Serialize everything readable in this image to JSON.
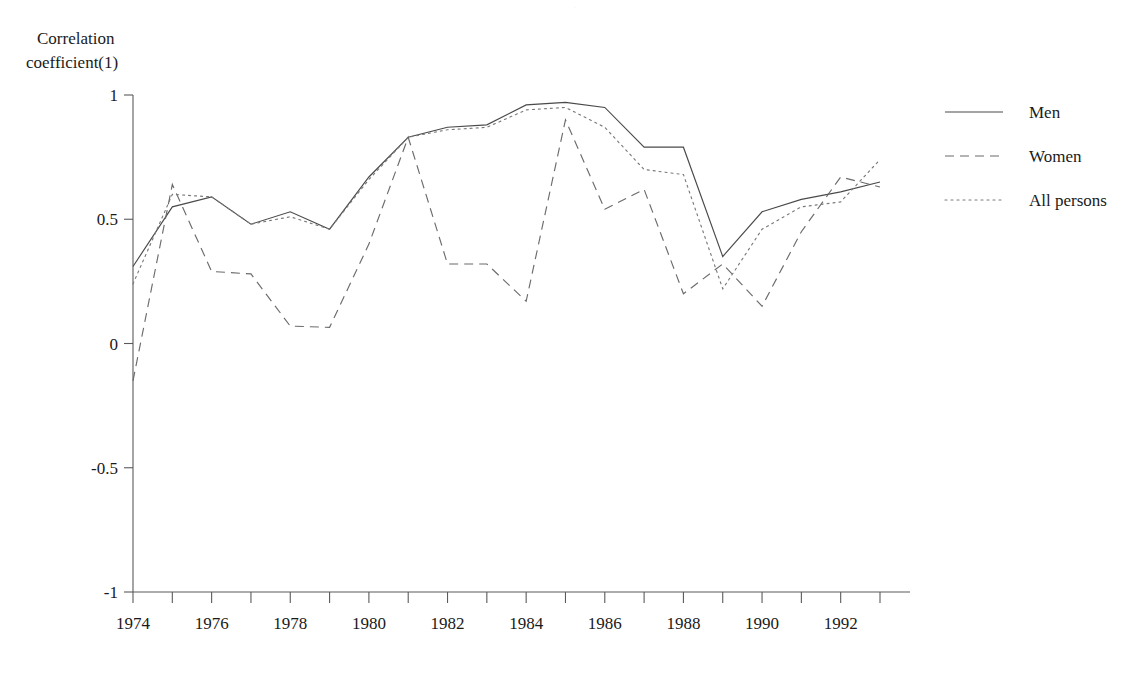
{
  "axis": {
    "ylabel_line1": "Correlation",
    "ylabel_line2": "coefficient(1)",
    "y_ticks": [
      "1",
      "0.5",
      "0",
      "-0.5",
      "-1"
    ],
    "y_tick_values": [
      1,
      0.5,
      0,
      -0.5,
      -1
    ],
    "x_tick_labels": [
      "1974",
      "1976",
      "1978",
      "1980",
      "1982",
      "1984",
      "1986",
      "1988",
      "1990",
      "1992"
    ]
  },
  "legend": {
    "position": "right",
    "items": [
      {
        "label": "Men",
        "style": "solid",
        "color": "#4a4a4a"
      },
      {
        "label": "Women",
        "style": "dashed",
        "color": "#6b6b6b"
      },
      {
        "label": "All persons",
        "style": "dotted",
        "color": "#7a7a7a"
      }
    ]
  },
  "chart_data": {
    "type": "line",
    "title": "",
    "xlabel": "",
    "ylabel": "Correlation coefficient(1)",
    "xlim": [
      1974,
      1993
    ],
    "ylim": [
      -1,
      1
    ],
    "grid": false,
    "legend_position": "right",
    "x": [
      1974,
      1975,
      1976,
      1977,
      1978,
      1979,
      1980,
      1981,
      1982,
      1983,
      1984,
      1985,
      1986,
      1987,
      1988,
      1989,
      1990,
      1991,
      1992,
      1993
    ],
    "series": [
      {
        "name": "Men",
        "style": "solid",
        "values": [
          0.31,
          0.55,
          0.59,
          0.48,
          0.53,
          0.46,
          0.67,
          0.83,
          0.87,
          0.88,
          0.96,
          0.97,
          0.95,
          0.79,
          0.79,
          0.35,
          0.53,
          0.58,
          0.61,
          0.65
        ]
      },
      {
        "name": "Women",
        "style": "dashed",
        "values": [
          -0.15,
          0.64,
          0.29,
          0.28,
          0.07,
          0.065,
          0.4,
          0.83,
          0.32,
          0.32,
          0.17,
          0.9,
          0.54,
          0.62,
          0.2,
          0.32,
          0.15,
          0.45,
          0.67,
          0.63
        ]
      },
      {
        "name": "All persons",
        "style": "dotted",
        "values": [
          0.24,
          0.6,
          0.59,
          0.48,
          0.51,
          0.46,
          0.66,
          0.83,
          0.86,
          0.87,
          0.94,
          0.95,
          0.87,
          0.7,
          0.68,
          0.22,
          0.46,
          0.55,
          0.57,
          0.74
        ]
      }
    ]
  }
}
